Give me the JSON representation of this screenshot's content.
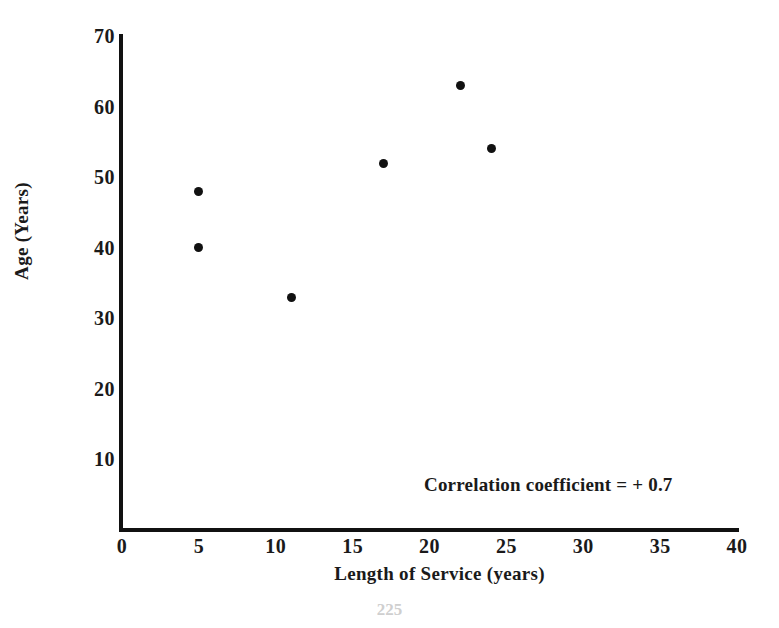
{
  "chart_data": {
    "type": "scatter",
    "title": "",
    "xlabel": "Length of Service (years)",
    "ylabel": "Age (Years)",
    "xlim": [
      0,
      40
    ],
    "ylim": [
      0,
      70
    ],
    "xticks": [
      0,
      5,
      10,
      15,
      20,
      25,
      30,
      35,
      40
    ],
    "yticks": [
      10,
      20,
      30,
      40,
      50,
      60,
      70
    ],
    "xtick_labels": [
      "0",
      "5",
      "10",
      "15",
      "20",
      "25",
      "30",
      "35",
      "40"
    ],
    "ytick_labels": [
      "10",
      "20",
      "30",
      "40",
      "50",
      "60",
      "70"
    ],
    "grid": false,
    "legend": false,
    "series": [
      {
        "name": "employees",
        "points": [
          {
            "x": 5,
            "y": 48
          },
          {
            "x": 5,
            "y": 40
          },
          {
            "x": 11,
            "y": 33
          },
          {
            "x": 17,
            "y": 52
          },
          {
            "x": 22,
            "y": 63
          },
          {
            "x": 24,
            "y": 54
          }
        ]
      }
    ],
    "annotations": [
      {
        "text": "Correlation coefficient = + 0.7",
        "x": 24,
        "y": 11
      }
    ],
    "marker_color": "#111111",
    "axis_color": "#111111"
  },
  "footer": {
    "page_number": "225"
  }
}
